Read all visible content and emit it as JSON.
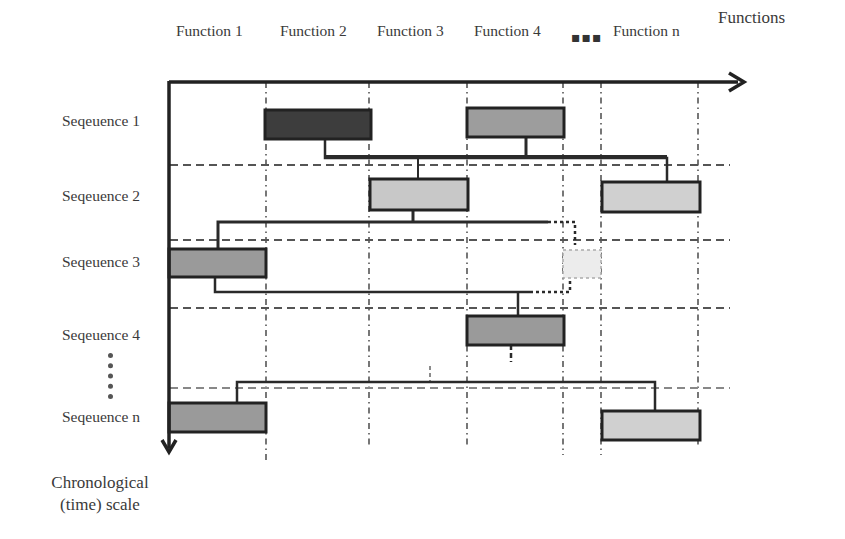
{
  "diagram": {
    "x_axis_title": "Functions",
    "y_axis_title_line1": "Chronological",
    "y_axis_title_line2": "(time) scale",
    "functions": [
      "Function 1",
      "Function 2",
      "Function 3",
      "Function 4",
      "Function n"
    ],
    "functions_ellipsis": "▪▪▪",
    "sequences": [
      "Seqeuence 1",
      "Seqeuence 2",
      "Seqeuence 3",
      "Seqeuence 4",
      "Seqeuence n"
    ],
    "colors": {
      "axis": "#222222",
      "dark_box": "#3d3d3d",
      "mid_box": "#9a9a9a",
      "light_box": "#cfcfcf",
      "faded_box": "#ececec",
      "gridline": "#555555"
    },
    "blocks": [
      {
        "sequence": "Seqeuence 1",
        "function": "Function 2",
        "shade": "dark"
      },
      {
        "sequence": "Seqeuence 1",
        "function": "Function 4",
        "shade": "mid"
      },
      {
        "sequence": "Seqeuence 2",
        "function": "Function 3",
        "shade": "light"
      },
      {
        "sequence": "Seqeuence 2",
        "function": "Function n",
        "shade": "light"
      },
      {
        "sequence": "Seqeuence 3",
        "function": "Function 1",
        "shade": "mid"
      },
      {
        "sequence": "Seqeuence 3",
        "function": "between Function 4 and Function n",
        "shade": "faded-dashed"
      },
      {
        "sequence": "Seqeuence 4",
        "function": "Function 4",
        "shade": "mid"
      },
      {
        "sequence": "Seqeuence n",
        "function": "Function 1",
        "shade": "mid"
      },
      {
        "sequence": "Seqeuence n",
        "function": "Function n",
        "shade": "light"
      }
    ]
  }
}
